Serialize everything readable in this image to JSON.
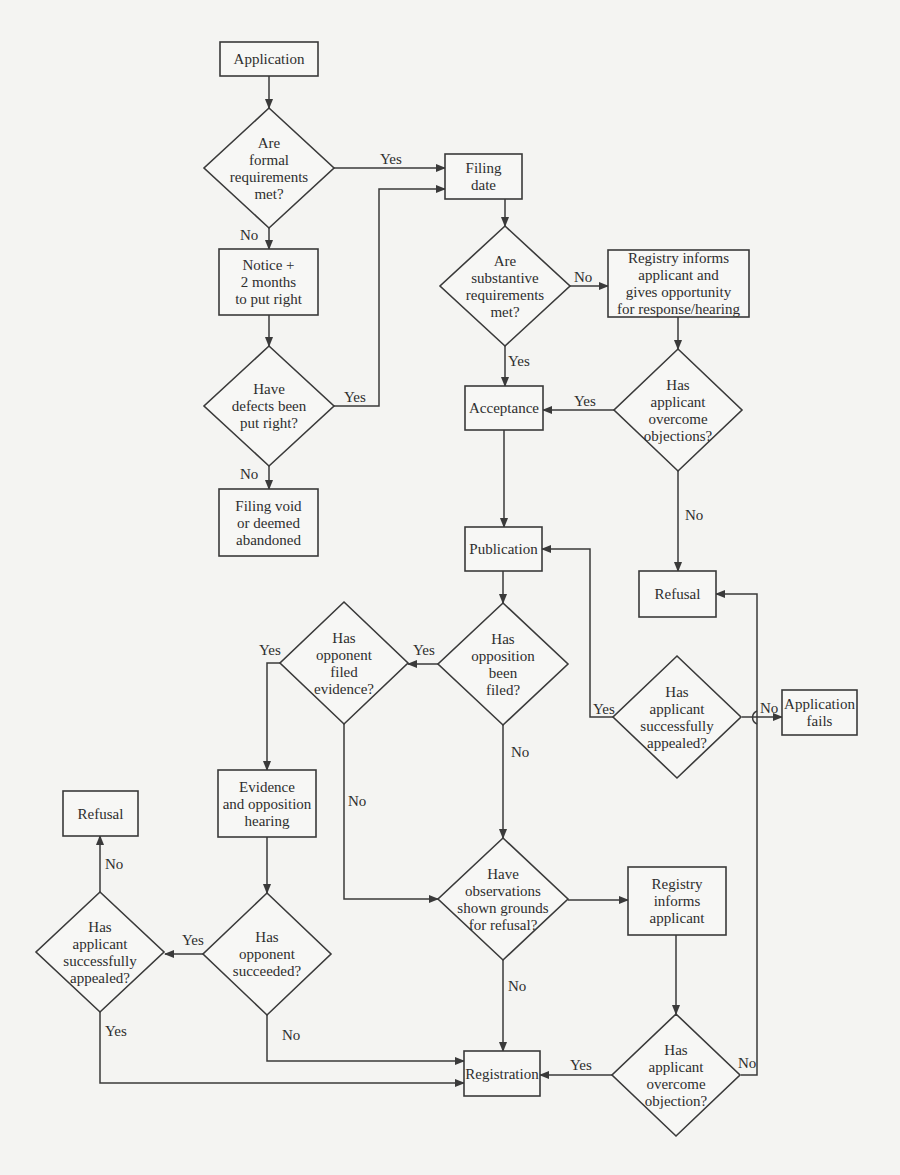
{
  "diagram": {
    "type": "flowchart",
    "nodes": [
      {
        "id": "application",
        "shape": "rect",
        "x": 220,
        "y": 42,
        "w": 98,
        "h": 34,
        "lines": [
          "Application"
        ]
      },
      {
        "id": "formal_req",
        "shape": "diamond",
        "cx": 269,
        "cy": 168,
        "rx": 65,
        "ry": 60,
        "lines": [
          "Are",
          "formal",
          "requirements",
          "met?"
        ]
      },
      {
        "id": "filing_date",
        "shape": "rect",
        "x": 445,
        "y": 154,
        "w": 77,
        "h": 45,
        "lines": [
          "Filing",
          "date"
        ]
      },
      {
        "id": "notice",
        "shape": "rect",
        "x": 219,
        "y": 249,
        "w": 99,
        "h": 66,
        "lines": [
          "Notice +",
          "2 months",
          "to put right"
        ]
      },
      {
        "id": "defects_right",
        "shape": "diamond",
        "cx": 269,
        "cy": 406,
        "rx": 65,
        "ry": 60,
        "lines": [
          "Have",
          "defects been",
          "put right?"
        ]
      },
      {
        "id": "filing_void",
        "shape": "rect",
        "x": 219,
        "y": 489,
        "w": 99,
        "h": 67,
        "lines": [
          "Filing void",
          "or deemed",
          "abandoned"
        ]
      },
      {
        "id": "substantive_req",
        "shape": "diamond",
        "cx": 505,
        "cy": 286,
        "rx": 65,
        "ry": 60,
        "lines": [
          "Are",
          "substantive",
          "requirements",
          "met?"
        ]
      },
      {
        "id": "registry_informs_1",
        "shape": "rect",
        "x": 608,
        "y": 250,
        "w": 141,
        "h": 67,
        "lines": [
          "Registry informs",
          "applicant and",
          "gives opportunity",
          "for response/hearing"
        ]
      },
      {
        "id": "overcome_objections",
        "shape": "diamond",
        "cx": 678,
        "cy": 410,
        "rx": 64,
        "ry": 61,
        "lines": [
          "Has",
          "applicant",
          "overcome",
          "objections?"
        ]
      },
      {
        "id": "acceptance",
        "shape": "rect",
        "x": 465,
        "y": 386,
        "w": 78,
        "h": 44,
        "lines": [
          "Acceptance"
        ]
      },
      {
        "id": "publication",
        "shape": "rect",
        "x": 465,
        "y": 527,
        "w": 77,
        "h": 44,
        "lines": [
          "Publication"
        ]
      },
      {
        "id": "refusal_right",
        "shape": "rect",
        "x": 639,
        "y": 571,
        "w": 77,
        "h": 46,
        "lines": [
          "Refusal"
        ]
      },
      {
        "id": "opposition_filed",
        "shape": "diamond",
        "cx": 503,
        "cy": 664,
        "rx": 65,
        "ry": 61,
        "lines": [
          "Has",
          "opposition",
          "been",
          "filed?"
        ]
      },
      {
        "id": "opponent_evidence",
        "shape": "diamond",
        "cx": 344,
        "cy": 663,
        "rx": 64,
        "ry": 61,
        "lines": [
          "Has",
          "opponent",
          "filed",
          "evidence?"
        ]
      },
      {
        "id": "appealed_right",
        "shape": "diamond",
        "cx": 677,
        "cy": 717,
        "rx": 64,
        "ry": 61,
        "lines": [
          "Has",
          "applicant",
          "successfully",
          "appealed?"
        ]
      },
      {
        "id": "application_fails",
        "shape": "rect",
        "x": 782,
        "y": 690,
        "w": 75,
        "h": 45,
        "lines": [
          "Application",
          "fails"
        ]
      },
      {
        "id": "evidence_hearing",
        "shape": "rect",
        "x": 218,
        "y": 770,
        "w": 98,
        "h": 67,
        "lines": [
          "Evidence",
          "and opposition",
          "hearing"
        ]
      },
      {
        "id": "refusal_left",
        "shape": "rect",
        "x": 63,
        "y": 791,
        "w": 75,
        "h": 45,
        "lines": [
          "Refusal"
        ]
      },
      {
        "id": "opponent_succeeded",
        "shape": "diamond",
        "cx": 267,
        "cy": 954,
        "rx": 64,
        "ry": 61,
        "lines": [
          "Has",
          "opponent",
          "succeeded?"
        ]
      },
      {
        "id": "appealed_left",
        "shape": "diamond",
        "cx": 100,
        "cy": 952,
        "rx": 64,
        "ry": 60,
        "lines": [
          "Has",
          "applicant",
          "successfully",
          "appealed?"
        ]
      },
      {
        "id": "observations",
        "shape": "diamond",
        "cx": 503,
        "cy": 899,
        "rx": 65,
        "ry": 61,
        "lines": [
          "Have",
          "observations",
          "shown grounds",
          "for refusal?"
        ]
      },
      {
        "id": "registry_informs_2",
        "shape": "rect",
        "x": 628,
        "y": 867,
        "w": 98,
        "h": 68,
        "lines": [
          "Registry",
          "informs",
          "applicant"
        ]
      },
      {
        "id": "overcome_objection",
        "shape": "diamond",
        "cx": 676,
        "cy": 1075,
        "rx": 64,
        "ry": 61,
        "lines": [
          "Has",
          "applicant",
          "overcome",
          "objection?"
        ]
      },
      {
        "id": "registration",
        "shape": "rect",
        "x": 464,
        "y": 1051,
        "w": 76,
        "h": 45,
        "lines": [
          "Registration"
        ]
      }
    ],
    "edges": [
      {
        "from": "application",
        "to": "formal_req",
        "label": "",
        "points": [
          [
            269,
            76
          ],
          [
            269,
            108
          ]
        ]
      },
      {
        "from": "formal_req",
        "to": "filing_date",
        "label": "Yes",
        "label_pos": [
          380,
          164
        ],
        "points": [
          [
            334,
            168
          ],
          [
            445,
            168
          ]
        ]
      },
      {
        "from": "formal_req",
        "to": "notice",
        "label": "No",
        "label_pos": [
          240,
          240
        ],
        "points": [
          [
            269,
            228
          ],
          [
            269,
            249
          ]
        ]
      },
      {
        "from": "notice",
        "to": "defects_right",
        "label": "",
        "points": [
          [
            269,
            315
          ],
          [
            269,
            346
          ]
        ]
      },
      {
        "from": "defects_right",
        "to": "filing_date",
        "label": "Yes",
        "label_pos": [
          344,
          402
        ],
        "points": [
          [
            334,
            406
          ],
          [
            379,
            406
          ],
          [
            379,
            189
          ],
          [
            445,
            189
          ]
        ]
      },
      {
        "from": "defects_right",
        "to": "filing_void",
        "label": "No",
        "label_pos": [
          240,
          479
        ],
        "points": [
          [
            269,
            466
          ],
          [
            269,
            489
          ]
        ]
      },
      {
        "from": "filing_date",
        "to": "substantive_req",
        "label": "",
        "points": [
          [
            505,
            199
          ],
          [
            505,
            226
          ]
        ]
      },
      {
        "from": "substantive_req",
        "to": "registry_informs_1",
        "label": "No",
        "label_pos": [
          574,
          282
        ],
        "points": [
          [
            570,
            286
          ],
          [
            608,
            286
          ]
        ]
      },
      {
        "from": "substantive_req",
        "to": "acceptance",
        "label": "Yes",
        "label_pos": [
          508,
          366
        ],
        "points": [
          [
            505,
            346
          ],
          [
            505,
            386
          ]
        ]
      },
      {
        "from": "registry_informs_1",
        "to": "overcome_objections",
        "label": "",
        "points": [
          [
            678,
            317
          ],
          [
            678,
            349
          ]
        ]
      },
      {
        "from": "overcome_objections",
        "to": "acceptance",
        "label": "Yes",
        "label_pos": [
          574,
          406
        ],
        "points": [
          [
            614,
            410
          ],
          [
            543,
            410
          ]
        ]
      },
      {
        "from": "overcome_objections",
        "to": "refusal_right",
        "label": "No",
        "label_pos": [
          685,
          520
        ],
        "points": [
          [
            678,
            471
          ],
          [
            678,
            571
          ]
        ]
      },
      {
        "from": "acceptance",
        "to": "publication",
        "label": "",
        "points": [
          [
            504,
            430
          ],
          [
            504,
            527
          ]
        ]
      },
      {
        "from": "publication",
        "to": "opposition_filed",
        "label": "",
        "points": [
          [
            503,
            571
          ],
          [
            503,
            603
          ]
        ]
      },
      {
        "from": "opposition_filed",
        "to": "opponent_evidence",
        "label": "Yes",
        "label_pos": [
          413,
          655
        ],
        "points": [
          [
            438,
            664
          ],
          [
            408,
            664
          ]
        ]
      },
      {
        "from": "opposition_filed",
        "to": "observations",
        "label": "No",
        "label_pos": [
          511,
          757
        ],
        "points": [
          [
            503,
            725
          ],
          [
            503,
            838
          ]
        ]
      },
      {
        "from": "opponent_evidence",
        "to": "evidence_hearing",
        "label": "Yes",
        "label_pos": [
          259,
          655
        ],
        "points": [
          [
            280,
            663
          ],
          [
            267,
            663
          ],
          [
            267,
            770
          ]
        ]
      },
      {
        "from": "opponent_evidence",
        "to": "observations",
        "label": "No",
        "label_pos": [
          348,
          806
        ],
        "points": [
          [
            344,
            724
          ],
          [
            344,
            899
          ],
          [
            438,
            899
          ]
        ]
      },
      {
        "from": "appealed_right",
        "to": "publication",
        "label": "Yes",
        "label_pos": [
          593,
          714
        ],
        "points": [
          [
            613,
            717
          ],
          [
            590,
            717
          ],
          [
            590,
            549
          ],
          [
            542,
            549
          ]
        ]
      },
      {
        "from": "appealed_right",
        "to": "application_fails",
        "label": "No",
        "label_pos": [
          760,
          713
        ],
        "points": [
          [
            742,
            717
          ],
          [
            782,
            717
          ]
        ]
      },
      {
        "from": "evidence_hearing",
        "to": "opponent_succeeded",
        "label": "",
        "points": [
          [
            267,
            837
          ],
          [
            267,
            893
          ]
        ]
      },
      {
        "from": "opponent_succeeded",
        "to": "appealed_left",
        "label": "Yes",
        "label_pos": [
          182,
          945
        ],
        "points": [
          [
            203,
            954
          ],
          [
            165,
            954
          ]
        ]
      },
      {
        "from": "opponent_succeeded",
        "to": "registration",
        "label": "No",
        "label_pos": [
          282,
          1040
        ],
        "points": [
          [
            267,
            1015
          ],
          [
            267,
            1061
          ],
          [
            464,
            1061
          ]
        ]
      },
      {
        "from": "appealed_left",
        "to": "refusal_left",
        "label": "No",
        "label_pos": [
          105,
          869
        ],
        "points": [
          [
            100,
            892
          ],
          [
            100,
            836
          ]
        ]
      },
      {
        "from": "appealed_left",
        "to": "registration",
        "label": "Yes",
        "label_pos": [
          105,
          1036
        ],
        "points": [
          [
            100,
            1012
          ],
          [
            100,
            1083
          ],
          [
            464,
            1083
          ]
        ]
      },
      {
        "from": "observations",
        "to": "registry_informs_2",
        "label": "",
        "points": [
          [
            568,
            900
          ],
          [
            628,
            900
          ]
        ]
      },
      {
        "from": "observations",
        "to": "registration",
        "label": "No",
        "label_pos": [
          508,
          991
        ],
        "points": [
          [
            503,
            960
          ],
          [
            503,
            1051
          ]
        ]
      },
      {
        "from": "registry_informs_2",
        "to": "overcome_objection",
        "label": "",
        "points": [
          [
            676,
            935
          ],
          [
            676,
            1014
          ]
        ]
      },
      {
        "from": "overcome_objection",
        "to": "registration",
        "label": "Yes",
        "label_pos": [
          570,
          1070
        ],
        "points": [
          [
            612,
            1075
          ],
          [
            540,
            1075
          ]
        ]
      },
      {
        "from": "overcome_objection",
        "to": "refusal_right",
        "label": "No",
        "label_pos": [
          738,
          1068
        ],
        "points": [
          [
            741,
            1075
          ],
          [
            757,
            1075
          ],
          [
            757,
            734
          ],
          [
            757,
            700
          ],
          [
            757,
            594
          ],
          [
            716,
            594
          ]
        ]
      }
    ]
  }
}
